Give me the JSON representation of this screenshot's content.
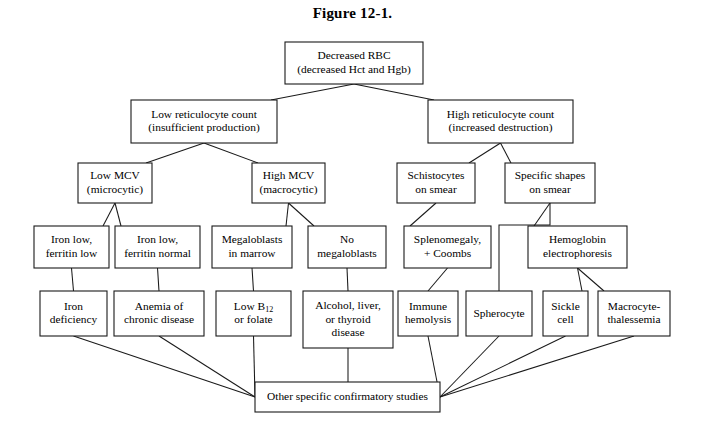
{
  "figure": {
    "title": "Figure 12-1.",
    "caption_position": "top-center"
  },
  "colors": {
    "box_stroke": "#1a1a1a",
    "box_fill": "#ffffff",
    "line": "#1a1a1a",
    "text": "#000000",
    "background": "#ffffff"
  },
  "chart_data": {
    "type": "diagram",
    "subtype": "flowchart",
    "title": "Figure 12-1.",
    "orientation": "top-down",
    "nodes": [
      {
        "id": "decreased_rbc",
        "lines": [
          "Decreased RBC",
          "(decreased Hct and Hgb)"
        ],
        "x": 285,
        "y": 42,
        "w": 138,
        "h": 42,
        "level": 0
      },
      {
        "id": "low_retic",
        "lines": [
          "Low reticulocyte count",
          "(insufficient production)"
        ],
        "x": 131,
        "y": 100,
        "w": 146,
        "h": 43,
        "level": 1
      },
      {
        "id": "high_retic",
        "lines": [
          "High reticulocyte count",
          "(increased destruction)"
        ],
        "x": 428,
        "y": 100,
        "w": 145,
        "h": 43,
        "level": 1
      },
      {
        "id": "low_mcv",
        "lines": [
          "Low MCV",
          "(microcytic)"
        ],
        "x": 78,
        "y": 163,
        "w": 74,
        "h": 40,
        "level": 2
      },
      {
        "id": "high_mcv",
        "lines": [
          "High MCV",
          "(macrocytic)"
        ],
        "x": 252,
        "y": 163,
        "w": 73,
        "h": 40,
        "level": 2
      },
      {
        "id": "schistocytes",
        "lines": [
          "Schistocytes",
          "on smear"
        ],
        "x": 397,
        "y": 163,
        "w": 78,
        "h": 40,
        "level": 2
      },
      {
        "id": "specific_shapes",
        "lines": [
          "Specific shapes",
          "on smear"
        ],
        "x": 505,
        "y": 163,
        "w": 90,
        "h": 40,
        "level": 2
      },
      {
        "id": "iron_low_fer_low",
        "lines": [
          "Iron low,",
          "ferritin low"
        ],
        "x": 34,
        "y": 226,
        "w": 75,
        "h": 42,
        "level": 3
      },
      {
        "id": "iron_low_fer_norm",
        "lines": [
          "Iron low,",
          "ferritin normal"
        ],
        "x": 115,
        "y": 226,
        "w": 85,
        "h": 42,
        "level": 3
      },
      {
        "id": "megaloblasts",
        "lines": [
          "Megaloblasts",
          "in marrow"
        ],
        "x": 212,
        "y": 226,
        "w": 80,
        "h": 42,
        "level": 3
      },
      {
        "id": "no_megaloblasts",
        "lines": [
          "No",
          "megaloblasts"
        ],
        "x": 308,
        "y": 226,
        "w": 78,
        "h": 42,
        "level": 3
      },
      {
        "id": "splenomegaly",
        "lines": [
          "Splenomegaly,",
          "+ Coombs"
        ],
        "x": 404,
        "y": 226,
        "w": 87,
        "h": 42,
        "level": 3
      },
      {
        "id": "hgb_electrophoresis",
        "lines": [
          "Hemoglobin",
          "electrophoresis"
        ],
        "x": 528,
        "y": 226,
        "w": 99,
        "h": 42,
        "level": 3
      },
      {
        "id": "iron_deficiency",
        "lines": [
          "Iron",
          "deficiency"
        ],
        "x": 40,
        "y": 291,
        "w": 67,
        "h": 45,
        "level": 4
      },
      {
        "id": "anemia_chronic",
        "lines": [
          "Anemia of",
          "chronic disease"
        ],
        "x": 114,
        "y": 291,
        "w": 90,
        "h": 45,
        "level": 4
      },
      {
        "id": "low_b12_folate",
        "lines": [
          "Low B12",
          "or folate"
        ],
        "x": 216,
        "y": 291,
        "w": 75,
        "h": 45,
        "level": 4,
        "subscript": "12"
      },
      {
        "id": "alcohol_liver_thyroid",
        "lines": [
          "Alcohol, liver,",
          "or thyroid",
          "disease"
        ],
        "x": 303,
        "y": 291,
        "w": 90,
        "h": 57,
        "level": 4
      },
      {
        "id": "immune_hemolysis",
        "lines": [
          "Immune",
          "hemolysis"
        ],
        "x": 398,
        "y": 291,
        "w": 60,
        "h": 45,
        "level": 4
      },
      {
        "id": "spherocyte",
        "lines": [
          "Spherocyte"
        ],
        "x": 466,
        "y": 291,
        "w": 66,
        "h": 45,
        "level": 4
      },
      {
        "id": "sickle_cell",
        "lines": [
          "Sickle",
          "cell"
        ],
        "x": 543,
        "y": 291,
        "w": 45,
        "h": 45,
        "level": 4
      },
      {
        "id": "macrocyte_thal",
        "lines": [
          "Macrocyte-",
          "thalessemia"
        ],
        "x": 598,
        "y": 291,
        "w": 72,
        "h": 45,
        "level": 4
      },
      {
        "id": "other_studies",
        "lines": [
          "Other specific confirmatory studies"
        ],
        "x": 255,
        "y": 382,
        "w": 185,
        "h": 30,
        "level": 5
      }
    ],
    "edges": [
      {
        "from": "decreased_rbc",
        "to": "low_retic",
        "style": "diagonal"
      },
      {
        "from": "decreased_rbc",
        "to": "high_retic",
        "style": "diagonal"
      },
      {
        "from": "low_retic",
        "to": "low_mcv",
        "style": "diagonal"
      },
      {
        "from": "low_retic",
        "to": "high_mcv",
        "style": "diagonal"
      },
      {
        "from": "high_retic",
        "to": "schistocytes",
        "style": "diagonal"
      },
      {
        "from": "high_retic",
        "to": "specific_shapes",
        "style": "diagonal"
      },
      {
        "from": "low_mcv",
        "to": "iron_low_fer_low",
        "style": "diagonal"
      },
      {
        "from": "low_mcv",
        "to": "iron_low_fer_norm",
        "style": "diagonal"
      },
      {
        "from": "high_mcv",
        "to": "megaloblasts",
        "style": "diagonal"
      },
      {
        "from": "high_mcv",
        "to": "no_megaloblasts",
        "style": "diagonal"
      },
      {
        "from": "schistocytes",
        "to": "splenomegaly",
        "style": "diagonal"
      },
      {
        "from": "specific_shapes",
        "to": "hgb_electrophoresis",
        "style": "diagonal"
      },
      {
        "from": "specific_shapes",
        "to": "spherocyte",
        "style": "elbow"
      },
      {
        "from": "iron_low_fer_low",
        "to": "iron_deficiency",
        "style": "short"
      },
      {
        "from": "iron_low_fer_norm",
        "to": "anemia_chronic",
        "style": "short"
      },
      {
        "from": "megaloblasts",
        "to": "low_b12_folate",
        "style": "short"
      },
      {
        "from": "no_megaloblasts",
        "to": "alcohol_liver_thyroid",
        "style": "short"
      },
      {
        "from": "splenomegaly",
        "to": "immune_hemolysis",
        "style": "short"
      },
      {
        "from": "hgb_electrophoresis",
        "to": "sickle_cell",
        "style": "diagonal"
      },
      {
        "from": "hgb_electrophoresis",
        "to": "macrocyte_thal",
        "style": "diagonal"
      },
      {
        "from": "iron_deficiency",
        "to": "other_studies",
        "style": "converge-left"
      },
      {
        "from": "anemia_chronic",
        "to": "other_studies",
        "style": "converge-left"
      },
      {
        "from": "low_b12_folate",
        "to": "other_studies",
        "style": "converge-left"
      },
      {
        "from": "alcohol_liver_thyroid",
        "to": "other_studies",
        "style": "converge-vertical"
      },
      {
        "from": "immune_hemolysis",
        "to": "other_studies",
        "style": "converge-right"
      },
      {
        "from": "spherocyte",
        "to": "other_studies",
        "style": "converge-right"
      },
      {
        "from": "sickle_cell",
        "to": "other_studies",
        "style": "converge-right"
      },
      {
        "from": "macrocyte_thal",
        "to": "other_studies",
        "style": "converge-right"
      }
    ],
    "annotations": []
  }
}
